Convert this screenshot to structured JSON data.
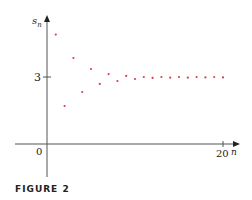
{
  "figure": {
    "caption": "FIGURE 2"
  },
  "axes": {
    "y_label": "s",
    "y_label_sub": "n",
    "x_label": "n",
    "origin_label": "0",
    "y_tick_label": "3",
    "x_tick_label": "20"
  },
  "colors": {
    "points": "#d8414f",
    "axes": "#555555"
  },
  "chart_data": {
    "type": "scatter",
    "title": "",
    "xlabel": "n",
    "ylabel": "s_n",
    "x": [
      1,
      2,
      3,
      4,
      5,
      6,
      7,
      8,
      9,
      10,
      11,
      12,
      13,
      14,
      15,
      16,
      17,
      18,
      19,
      20
    ],
    "y": [
      4.9,
      1.7,
      3.85,
      2.33,
      3.36,
      2.69,
      3.13,
      2.82,
      3.05,
      2.91,
      3.0,
      2.96,
      3.0,
      2.97,
      3.0,
      2.97,
      3.0,
      2.98,
      3.0,
      2.98
    ],
    "x_ticks": [
      0,
      20
    ],
    "y_ticks": [
      3
    ],
    "xlim": [
      -1.5,
      21.5
    ],
    "ylim": [
      -1.5,
      5.7
    ],
    "grid": false,
    "legend": null,
    "annotation": "values converge to 3"
  }
}
